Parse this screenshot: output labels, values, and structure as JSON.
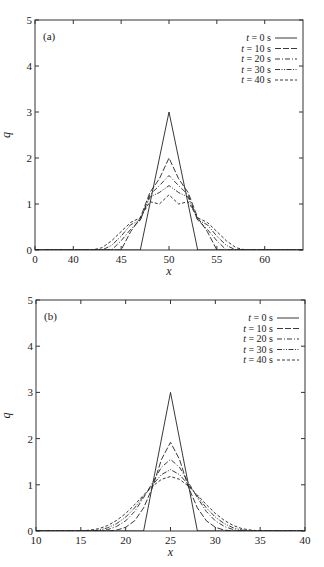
{
  "chart_data": [
    {
      "type": "line",
      "panel_label": "(a)",
      "title": "",
      "xlabel": "x",
      "ylabel": "q",
      "xlim": [
        36,
        64
      ],
      "ylim": [
        0,
        5
      ],
      "x_ticks": [
        36,
        40,
        45,
        50,
        55,
        60
      ],
      "x_tick_labels": [
        "0",
        "40",
        "45",
        "50",
        "55",
        "60"
      ],
      "y_ticks": [
        0,
        1,
        2,
        3,
        4,
        5
      ],
      "y_tick_labels": [
        "0",
        "1",
        "2",
        "3",
        "4",
        "5"
      ],
      "grid": false,
      "legend_position": "upper right",
      "series": [
        {
          "name": "t = 0 s",
          "dash": "solid",
          "x": [
            36,
            47,
            50,
            53,
            64
          ],
          "y": [
            0,
            0,
            3,
            0,
            0
          ]
        },
        {
          "name": "t = 10 s",
          "dash": "long-dash",
          "x": [
            36,
            45,
            46,
            47,
            48,
            49,
            50,
            51,
            52,
            53,
            54,
            55,
            64
          ],
          "y": [
            0,
            0,
            0.4,
            0.7,
            1.25,
            1.55,
            2.0,
            1.55,
            1.25,
            0.7,
            0.4,
            0,
            0
          ]
        },
        {
          "name": "t = 20 s",
          "dash": "dash-dot",
          "x": [
            36,
            44,
            45,
            46,
            47,
            48,
            49,
            50,
            51,
            52,
            53,
            54,
            55,
            56,
            64
          ],
          "y": [
            0,
            0,
            0.2,
            0.45,
            0.65,
            1.2,
            1.4,
            1.62,
            1.4,
            1.2,
            0.65,
            0.45,
            0.2,
            0,
            0
          ]
        },
        {
          "name": "t = 30 s",
          "dash": "dash-dot-dot",
          "x": [
            36,
            43,
            44,
            45,
            46,
            47,
            48,
            49,
            50,
            51,
            52,
            53,
            54,
            55,
            56,
            57,
            64
          ],
          "y": [
            0,
            0,
            0.1,
            0.3,
            0.55,
            0.65,
            1.15,
            1.25,
            1.4,
            1.25,
            1.15,
            0.65,
            0.55,
            0.3,
            0.1,
            0,
            0
          ]
        },
        {
          "name": "t = 40 s",
          "dash": "short-dash",
          "x": [
            36,
            42,
            43,
            44,
            45,
            46,
            47,
            48,
            49,
            50,
            51,
            52,
            53,
            54,
            55,
            56,
            57,
            58,
            64
          ],
          "y": [
            0,
            0,
            0.05,
            0.2,
            0.4,
            0.6,
            0.7,
            1.05,
            1.0,
            1.2,
            1.0,
            1.05,
            0.7,
            0.6,
            0.4,
            0.2,
            0.05,
            0,
            0
          ]
        }
      ]
    },
    {
      "type": "line",
      "panel_label": "(b)",
      "title": "",
      "xlabel": "x",
      "ylabel": "q",
      "xlim": [
        10,
        40
      ],
      "ylim": [
        0,
        5
      ],
      "x_ticks": [
        10,
        15,
        20,
        25,
        30,
        35,
        40
      ],
      "x_tick_labels": [
        "10",
        "15",
        "20",
        "25",
        "30",
        "35",
        "40"
      ],
      "y_ticks": [
        0,
        1,
        2,
        3,
        4,
        5
      ],
      "y_tick_labels": [
        "0",
        "1",
        "2",
        "3",
        "4",
        "5"
      ],
      "grid": false,
      "legend_position": "upper right",
      "series": [
        {
          "name": "t = 0 s",
          "dash": "solid",
          "x": [
            10,
            22,
            25,
            28,
            40
          ],
          "y": [
            0,
            0,
            3,
            0,
            0
          ]
        },
        {
          "name": "t = 10 s",
          "dash": "long-dash",
          "x": [
            10,
            18,
            19,
            20,
            21,
            22,
            23,
            24,
            25,
            26,
            27,
            28,
            29,
            30,
            31,
            32,
            40
          ],
          "y": [
            0,
            0,
            0.02,
            0.08,
            0.22,
            0.5,
            0.95,
            1.55,
            1.92,
            1.55,
            0.95,
            0.5,
            0.22,
            0.08,
            0.02,
            0,
            0
          ]
        },
        {
          "name": "t = 20 s",
          "dash": "dash-dot",
          "x": [
            10,
            17,
            18,
            19,
            20,
            21,
            22,
            23,
            24,
            25,
            26,
            27,
            28,
            29,
            30,
            31,
            32,
            33,
            40
          ],
          "y": [
            0,
            0,
            0.03,
            0.1,
            0.22,
            0.42,
            0.72,
            1.05,
            1.38,
            1.55,
            1.38,
            1.05,
            0.72,
            0.42,
            0.22,
            0.1,
            0.03,
            0,
            0
          ]
        },
        {
          "name": "t = 30 s",
          "dash": "dash-dot-dot",
          "x": [
            10,
            16,
            17,
            18,
            19,
            20,
            21,
            22,
            23,
            24,
            25,
            26,
            27,
            28,
            29,
            30,
            31,
            32,
            33,
            34,
            40
          ],
          "y": [
            0,
            0,
            0.02,
            0.07,
            0.16,
            0.3,
            0.5,
            0.75,
            1.0,
            1.22,
            1.33,
            1.22,
            1.0,
            0.75,
            0.5,
            0.3,
            0.16,
            0.07,
            0.02,
            0,
            0
          ]
        },
        {
          "name": "t = 40 s",
          "dash": "short-dash",
          "x": [
            10,
            15,
            16,
            17,
            18,
            19,
            20,
            21,
            22,
            23,
            24,
            25,
            26,
            27,
            28,
            29,
            30,
            31,
            32,
            33,
            34,
            35,
            40
          ],
          "y": [
            0,
            0,
            0.02,
            0.05,
            0.12,
            0.23,
            0.38,
            0.57,
            0.78,
            0.97,
            1.12,
            1.18,
            1.12,
            0.97,
            0.78,
            0.57,
            0.38,
            0.23,
            0.12,
            0.05,
            0.02,
            0,
            0
          ]
        }
      ]
    }
  ],
  "legend_time_symbol": "t",
  "legend_entries": [
    "= 0 s",
    "= 10 s",
    "= 20 s",
    "= 30 s",
    "= 40 s"
  ]
}
